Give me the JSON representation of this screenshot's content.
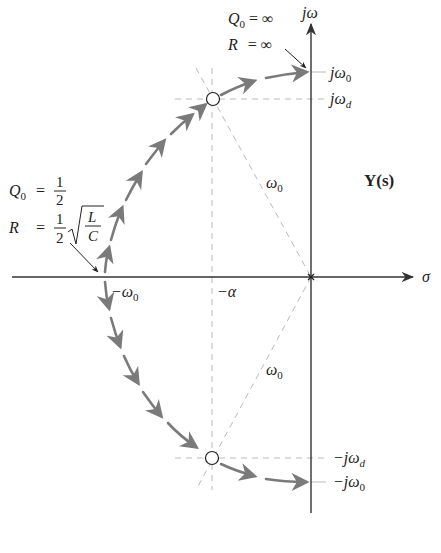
{
  "figure": {
    "title": "Y(s)",
    "axes": {
      "horizontal_label": "σ",
      "vertical_label": "jω"
    },
    "tick_labels": {
      "neg_omega0": {
        "base": "−ω",
        "sub": "0"
      },
      "neg_alpha": "−α",
      "j_omega0": {
        "base": "jω",
        "sub": "0"
      },
      "j_omegad": {
        "base": "jω",
        "sub": "d"
      },
      "neg_j_omegad": {
        "base": "−jω",
        "sub": "d"
      },
      "neg_j_omega0": {
        "base": "−jω",
        "sub": "0"
      }
    },
    "radius_labels": {
      "upper": {
        "base": "ω",
        "sub": "0"
      },
      "lower": {
        "base": "ω",
        "sub": "0"
      }
    },
    "annotations": {
      "top": {
        "q_line": {
          "lhs": "Q",
          "sub": "0",
          "rel": "= ∞"
        },
        "r_line": {
          "lhs": "R",
          "rel": "= ∞"
        }
      },
      "left": {
        "q_line": {
          "lhs": "Q",
          "sub": "0",
          "eq": "=",
          "num": "1",
          "den": "2"
        },
        "r_line": {
          "lhs": "R",
          "eq": "=",
          "num": "1",
          "den": "2",
          "sqrt_num": "L",
          "sqrt_den": "C"
        }
      }
    },
    "colors": {
      "axis": "#333333",
      "locus": "#7a7a7a",
      "dashed": "#bbbbbb",
      "text": "#222222"
    }
  }
}
